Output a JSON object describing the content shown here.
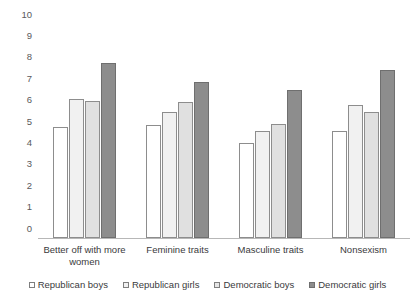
{
  "chart_data": {
    "type": "bar",
    "title": "",
    "subtitle": "",
    "xlabel": "",
    "ylabel": "",
    "ylim": [
      0,
      10
    ],
    "yticks": [
      0,
      1,
      2,
      3,
      4,
      5,
      6,
      7,
      8,
      9,
      10
    ],
    "grid": false,
    "legend_position": "bottom",
    "categories": [
      "Better off with more women",
      "Feminine traits",
      "Masculine traits",
      "Nonsexism"
    ],
    "series": [
      {
        "name": "Republican boys",
        "color": "#ffffff",
        "values": [
          5.2,
          5.3,
          4.45,
          5.0
        ]
      },
      {
        "name": "Republican girls",
        "color": "#f1f1f1",
        "values": [
          6.5,
          5.9,
          5.0,
          6.2
        ]
      },
      {
        "name": "Democratic boys",
        "color": "#e0e0e0",
        "values": [
          6.4,
          6.35,
          5.35,
          5.9
        ]
      },
      {
        "name": "Democratic girls",
        "color": "#8d8d8d",
        "values": [
          8.2,
          7.3,
          6.9,
          7.85
        ]
      }
    ]
  }
}
